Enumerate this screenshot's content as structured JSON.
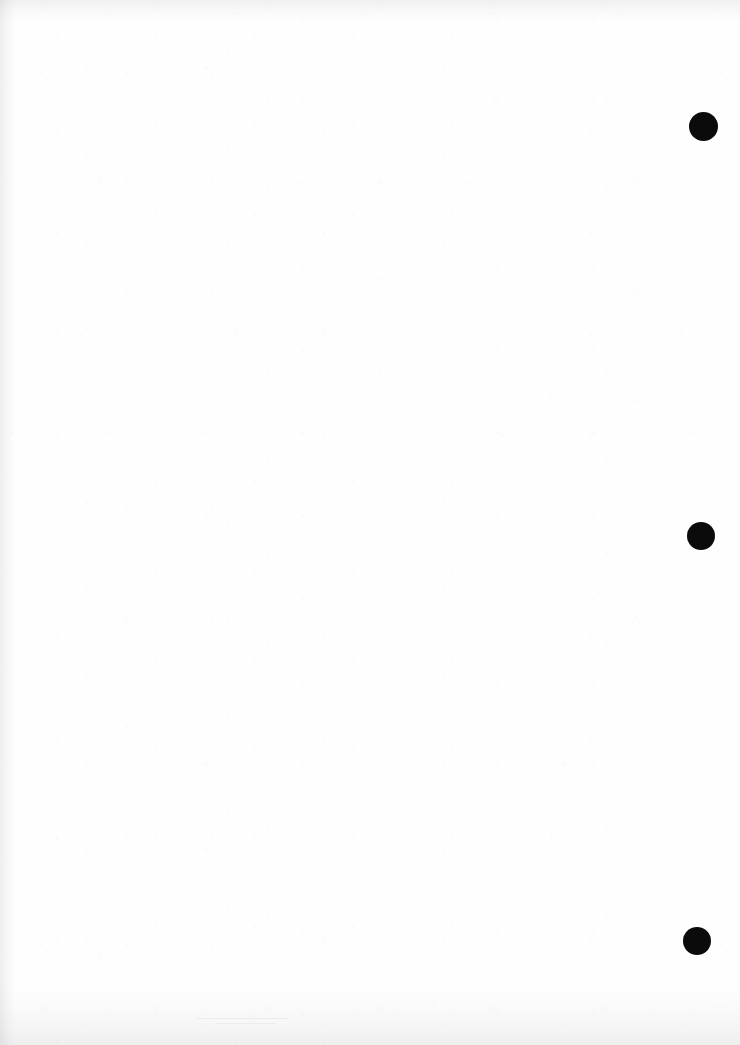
{
  "document": {
    "kind": "scanned-page",
    "page_content": "",
    "background_color": "#fefefe",
    "page_width": 740,
    "page_height": 1045
  },
  "marks": {
    "color": "#0b0b0b",
    "label": "black circular binding mark",
    "items": [
      {
        "name": "punch-mark-top",
        "x": 689,
        "y": 112,
        "size": 29
      },
      {
        "name": "punch-mark-middle",
        "x": 687,
        "y": 522,
        "size": 28
      },
      {
        "name": "punch-mark-bottom",
        "x": 683,
        "y": 927,
        "size": 28
      }
    ]
  },
  "artifacts": {
    "left_edge_shadow": "scan edge shadow",
    "top_edge_shadow": "scan edge shadow",
    "bottom_edge_shadow": "scan edge noise band",
    "streaks": [
      {
        "name": "faint-streak-lower",
        "x": 196,
        "y": 1018,
        "width": 92
      },
      {
        "name": "faint-streak-lower-2",
        "x": 215,
        "y": 1023,
        "width": 60
      }
    ]
  }
}
